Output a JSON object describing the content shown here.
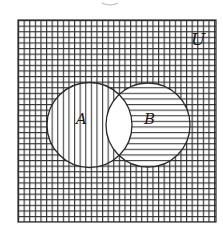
{
  "diagram": {
    "type": "venn",
    "universe": {
      "label": "U",
      "shading": "grid",
      "x": 18,
      "y": 20,
      "width": 198,
      "height": 202
    },
    "sets": [
      {
        "label": "A",
        "cx": 89.5,
        "cy": 125,
        "r": 42.5,
        "shading": "vertical-lines"
      },
      {
        "label": "B",
        "cx": 148,
        "cy": 125,
        "r": 42,
        "shading": "horizontal-lines"
      }
    ],
    "intersection": {
      "label": "A∩B",
      "shading": "none"
    },
    "colors": {
      "line": "#2a2a2a",
      "background": "#ffffff"
    },
    "grid_spacing": 5.6
  }
}
